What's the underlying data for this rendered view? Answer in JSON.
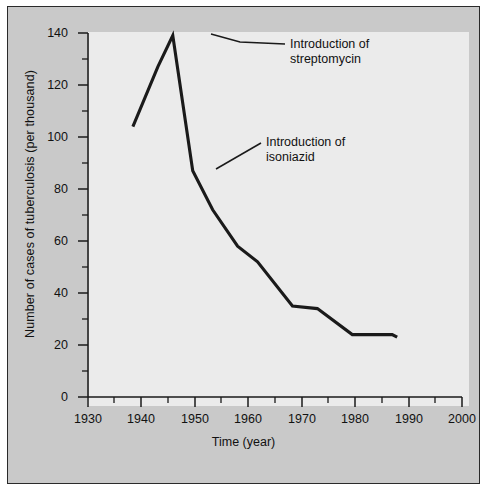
{
  "figure": {
    "background_color": "#c9c9c9",
    "plot_background_color": "#ebebeb",
    "line_color": "#1a1a1a",
    "axis_color": "#1a1a1a"
  },
  "annotations": [
    {
      "name": "streptomycin",
      "line1": "Introduction of",
      "line2": "streptomycin"
    },
    {
      "name": "isoniazid",
      "line1": "Introduction of",
      "line2": "isoniazid"
    }
  ],
  "caption": {
    "text": ""
  },
  "chart_data": {
    "type": "line",
    "title": "",
    "xlabel": "Time (year)",
    "ylabel": "Number of cases of tuberculosis (per thousand)",
    "xlim": [
      1930,
      2005
    ],
    "ylim": [
      0,
      140
    ],
    "xticks": [
      1930,
      1940,
      1950,
      1960,
      1970,
      1980,
      1990,
      2000
    ],
    "xtick_labels": [
      "1930",
      "1940",
      "1950",
      "1960",
      "1970",
      "1980",
      "1990",
      "2000"
    ],
    "xminor_ticks": [
      1935,
      1945,
      1955,
      1965,
      1975,
      1985,
      1995
    ],
    "yticks": [
      0,
      20,
      40,
      60,
      80,
      100,
      120,
      140
    ],
    "ytick_labels": [
      "0",
      "20",
      "40",
      "60",
      "80",
      "100",
      "120",
      "140"
    ],
    "yminor_ticks": [
      10,
      30,
      50,
      70,
      90,
      110,
      130
    ],
    "grid": false,
    "legend": "none",
    "series": [
      {
        "name": "Tuberculosis cases per thousand",
        "x": [
          1939,
          1944,
          1947,
          1951,
          1955,
          1960,
          1964,
          1971,
          1976,
          1983,
          1991,
          1992
        ],
        "values": [
          104,
          127,
          139,
          87,
          72,
          58,
          52,
          35,
          34,
          24,
          24,
          23
        ]
      }
    ],
    "annotation_points": [
      {
        "label": "Introduction of streptomycin",
        "x": 1947,
        "y": 139
      },
      {
        "label": "Introduction of isoniazid",
        "x": 1951,
        "y": 87
      }
    ]
  }
}
